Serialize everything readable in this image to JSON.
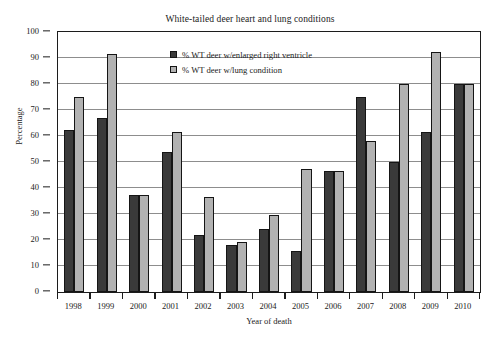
{
  "chart_data": {
    "type": "bar",
    "title": "White-tailed deer heart and lung conditions",
    "xlabel": "Year of death",
    "ylabel": "Percentage",
    "ylim": [
      0,
      100
    ],
    "ytick_step": 10,
    "yticks": [
      0,
      10,
      20,
      30,
      40,
      50,
      60,
      70,
      80,
      90,
      100
    ],
    "grid": "horizontal",
    "legend_position": "top-center-inside",
    "categories": [
      "1998",
      "1999",
      "2000",
      "2001",
      "2002",
      "2003",
      "2004",
      "2005",
      "2006",
      "2007",
      "2008",
      "2009",
      "2010"
    ],
    "series": [
      {
        "name": "% WT deer w/enlarged right ventricle",
        "color": "#3a3a3a",
        "values": [
          62.5,
          66.8,
          37.5,
          54.0,
          22.0,
          18.2,
          24.2,
          15.6,
          46.6,
          75.0,
          50.0,
          61.5,
          80.0
        ]
      },
      {
        "name": "% WT deer w/lung condition",
        "color": "#b2b2b2",
        "values": [
          75.0,
          91.5,
          37.5,
          61.5,
          36.5,
          19.4,
          29.7,
          47.4,
          46.6,
          58.2,
          80.0,
          92.2,
          80.0
        ]
      }
    ]
  }
}
